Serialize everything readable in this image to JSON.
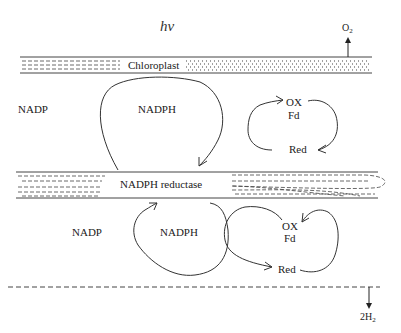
{
  "diagram": {
    "light_label": "hν",
    "oxygen": {
      "base": "O",
      "sub": "2"
    },
    "hydrogen": {
      "base": "2H",
      "sub": "2"
    },
    "membranes": {
      "chloroplast": {
        "label": "Chloroplast"
      },
      "reductase": {
        "label": "NADPH reductase"
      }
    },
    "upper_cycle": {
      "nadp": "NADP",
      "nadph": "NADPH",
      "fd_ox": "OX",
      "fd": "Fd",
      "fd_red": "Red"
    },
    "lower_cycle": {
      "nadp": "NADP",
      "nadph": "NADPH",
      "fd_ox": "OX",
      "fd": "Fd",
      "fd_red": "Red"
    },
    "colors": {
      "line": "#333333",
      "background": "#ffffff"
    }
  }
}
